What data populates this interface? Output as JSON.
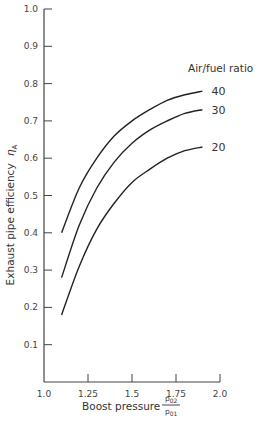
{
  "chart_data": {
    "type": "line",
    "title": "",
    "xlabel": "Boost pressure",
    "xlabel_fraction": {
      "numerator": "p02",
      "denominator": "p01"
    },
    "ylabel": "Exhaust pipe efficiency ηA",
    "xlim": [
      1.0,
      2.0
    ],
    "ylim": [
      0.0,
      1.0
    ],
    "grid": false,
    "x_ticks": [
      "1.0",
      "1.25",
      "1.5",
      "1.75",
      "2.0"
    ],
    "y_ticks": [
      "0.1",
      "0.2",
      "0.3",
      "0.4",
      "0.5",
      "0.6",
      "0.7",
      "0.8",
      "0.9",
      "1.0"
    ],
    "legend_title": "Air/fuel ratio",
    "legend_position": "inline-right",
    "x": [
      1.1,
      1.2,
      1.3,
      1.4,
      1.5,
      1.6,
      1.7,
      1.8,
      1.9
    ],
    "series": [
      {
        "name": "40",
        "values": [
          0.4,
          0.52,
          0.6,
          0.66,
          0.7,
          0.73,
          0.755,
          0.77,
          0.78
        ]
      },
      {
        "name": "30",
        "values": [
          0.28,
          0.42,
          0.52,
          0.59,
          0.64,
          0.675,
          0.7,
          0.72,
          0.73
        ]
      },
      {
        "name": "20",
        "values": [
          0.18,
          0.31,
          0.41,
          0.48,
          0.535,
          0.57,
          0.6,
          0.62,
          0.63
        ]
      }
    ]
  },
  "labels": {
    "xlabel": "Boost pressure",
    "frac_num": "p",
    "frac_num_sub": "02",
    "frac_den": "p",
    "frac_den_sub": "01",
    "ylabel": "Exhaust pipe efficiency",
    "ylabel_symbol": "η",
    "ylabel_symbol_sub": "A",
    "legend_title": "Air/fuel ratio"
  }
}
